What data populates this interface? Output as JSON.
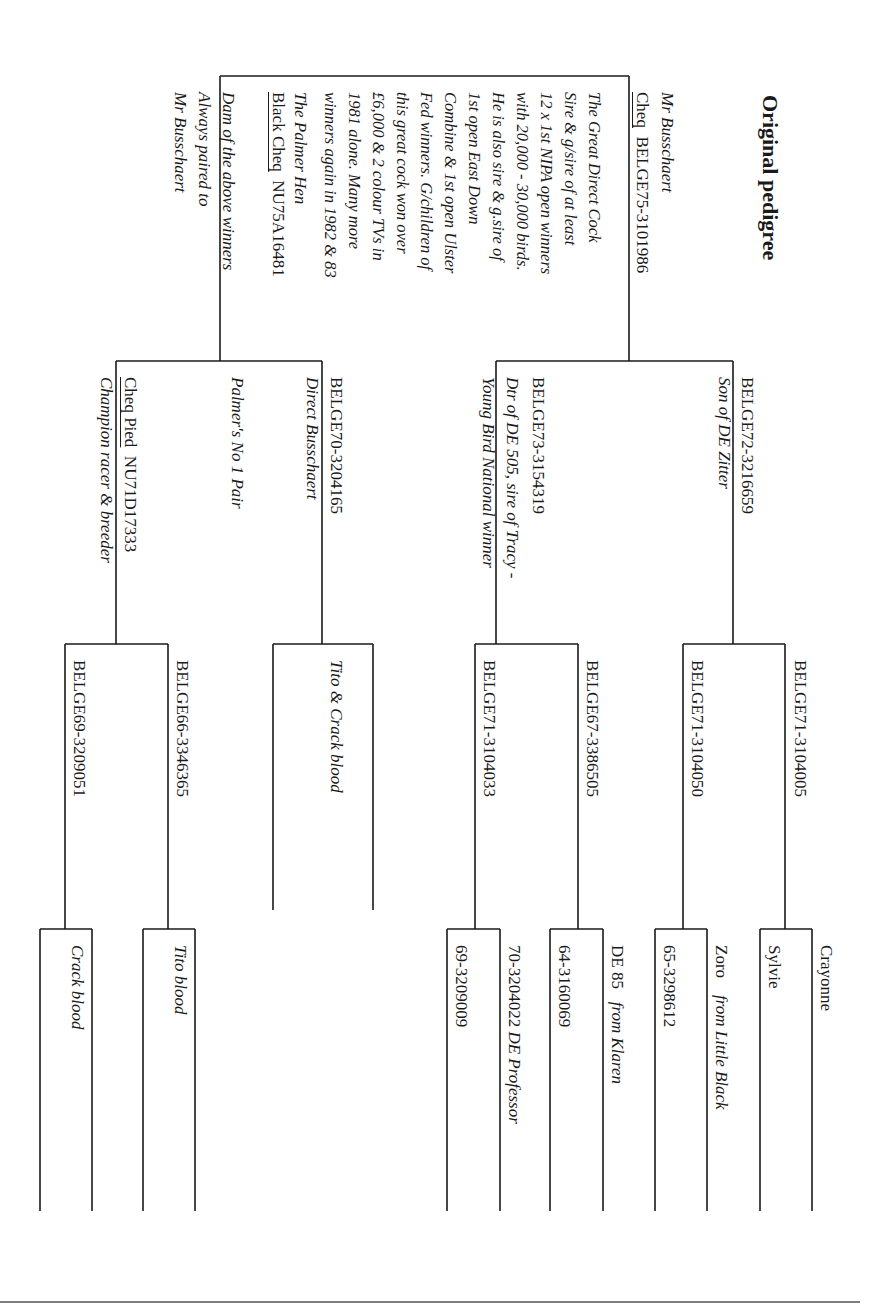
{
  "document": {
    "title": "Original pedigree",
    "orientation": "rotated 90 degrees clockwise"
  },
  "subject": {
    "breeder_line": "Mr Busschaert",
    "sire": {
      "colour": "Cheq",
      "ring": "BELGE75-3101986",
      "notes": [
        "The Great Direct Cock",
        "Sire & g/sire of at least",
        "12 x 1st NIPA open winners",
        "with 20,000 - 30,000 birds.",
        "He is also sire & g.sire of",
        "1st open East Down",
        "Combine & 1st open Ulster",
        "Fed winners. G/children of",
        "this great cock won over",
        "£6,000 & 2 colour TVs in",
        "1981 alone. Many more",
        "winners again in 1982 & 83"
      ]
    },
    "dam": {
      "name": "The Palmer Hen",
      "colour": "Black Cheq",
      "ring": "NU75A16481",
      "notes": [
        "Dam of the above winners",
        "Always paired to",
        "Mr Busschaert"
      ]
    }
  },
  "generation2": {
    "sire_side": {
      "sire": {
        "ring": "BELGE72-3216659",
        "note": "Son of DE Zitter"
      },
      "dam": {
        "ring": "BELGE73-3154319",
        "notes": [
          "Dtr of DE 505, sire of Tracy -",
          "Young Bird National winner"
        ]
      }
    },
    "dam_side": {
      "sire": {
        "ring": "BELGE70-3204165",
        "note": "Direct Busschaert"
      },
      "pair_note": "Palmer's No 1 Pair",
      "dam": {
        "colour": "Cheq Pied",
        "ring": "NU71D17333",
        "note": "Champion racer & breeder"
      }
    }
  },
  "generation3": {
    "g1": {
      "top": "BELGE71-3104005",
      "bottom": "BELGE71-3104050"
    },
    "g2": {
      "top": "BELGE67-3386505",
      "bottom": "BELGE71-3104033"
    },
    "g3": {
      "note": "Tito & Crack blood"
    },
    "g4": {
      "top": "BELGE66-3346365",
      "bottom": "BELGE69-3209051"
    }
  },
  "generation4": {
    "b1": {
      "top": "Crayonne",
      "bottom": "Sylvie"
    },
    "b2": {
      "top_name": "Zoro",
      "top_note": "from Little Black",
      "bottom": "65-3298612"
    },
    "b3": {
      "top_name": "DE 85",
      "top_note": "from Klaren",
      "bottom": "64-3160069"
    },
    "b4": {
      "top_ring": "70-3204022",
      "top_note": "DE Professor",
      "bottom": "69-3209009"
    },
    "b5": {
      "top": "Tito blood"
    },
    "b6": {
      "top": "Crack blood"
    }
  },
  "colors": {
    "ink": "#1a1a1a",
    "paper": "#ffffff",
    "rule": "#555555"
  }
}
